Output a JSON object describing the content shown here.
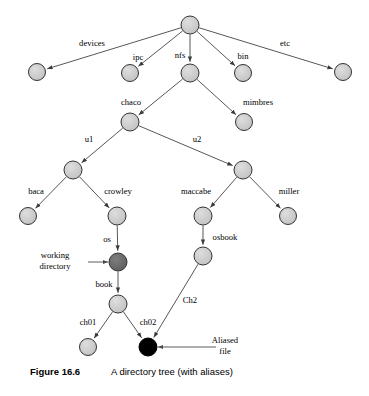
{
  "figure": {
    "caption_number": "Figure 16.6",
    "caption_title": "A directory tree (with aliases)",
    "background_color": "#ffffff"
  },
  "style": {
    "node_fill_normal": "#cccccc",
    "node_fill_working": "#6a6a6a",
    "node_fill_alias": "#000000",
    "node_stroke": "#333333",
    "edge_color": "#444444",
    "text_color": "#000000"
  },
  "diagram": {
    "type": "directory-tree",
    "nodes": [
      {
        "id": "root",
        "label": "",
        "x": 190,
        "y": 25,
        "r": 9,
        "kind": "normal"
      },
      {
        "id": "devices",
        "label": "devices",
        "x": 37,
        "y": 72,
        "r": 8.5,
        "kind": "normal"
      },
      {
        "id": "ipc",
        "label": "ipc",
        "x": 130,
        "y": 73,
        "r": 8.5,
        "kind": "normal"
      },
      {
        "id": "nfs",
        "label": "nfs",
        "x": 190,
        "y": 73,
        "r": 9,
        "kind": "normal"
      },
      {
        "id": "bin",
        "label": "bin",
        "x": 243,
        "y": 73,
        "r": 8.5,
        "kind": "normal"
      },
      {
        "id": "etc",
        "label": "etc",
        "x": 343,
        "y": 72,
        "r": 8.5,
        "kind": "normal"
      },
      {
        "id": "chaco",
        "label": "chaco",
        "x": 130,
        "y": 122,
        "r": 9,
        "kind": "normal"
      },
      {
        "id": "mimbres",
        "label": "mimbres",
        "x": 244,
        "y": 122,
        "r": 8.5,
        "kind": "normal"
      },
      {
        "id": "u1",
        "label": "u1",
        "x": 73,
        "y": 170,
        "r": 9,
        "kind": "normal"
      },
      {
        "id": "u2",
        "label": "u2",
        "x": 243,
        "y": 170,
        "r": 9,
        "kind": "normal"
      },
      {
        "id": "baca",
        "label": "baca",
        "x": 28,
        "y": 216,
        "r": 8.5,
        "kind": "normal"
      },
      {
        "id": "crowley",
        "label": "crowley",
        "x": 117,
        "y": 216,
        "r": 9,
        "kind": "normal"
      },
      {
        "id": "maccabe",
        "label": "maccabe",
        "x": 203,
        "y": 216,
        "r": 9,
        "kind": "normal"
      },
      {
        "id": "miller",
        "label": "miller",
        "x": 288,
        "y": 216,
        "r": 8.5,
        "kind": "normal"
      },
      {
        "id": "os",
        "label": "os",
        "x": 118,
        "y": 262,
        "r": 9,
        "kind": "working"
      },
      {
        "id": "osbook",
        "label": "osbook",
        "x": 203,
        "y": 256,
        "r": 9,
        "kind": "normal"
      },
      {
        "id": "book",
        "label": "book",
        "x": 118,
        "y": 304,
        "r": 9,
        "kind": "normal"
      },
      {
        "id": "ch01",
        "label": "ch01",
        "x": 88,
        "y": 347,
        "r": 8.5,
        "kind": "normal"
      },
      {
        "id": "ch02",
        "label": "ch02",
        "x": 148,
        "y": 347,
        "r": 9,
        "kind": "alias"
      }
    ],
    "edges": [
      {
        "from": "root",
        "to": "devices",
        "label": "devices",
        "label_x": 92,
        "label_y": 46
      },
      {
        "from": "root",
        "to": "ipc",
        "label": "ipc",
        "label_x": 138,
        "label_y": 60
      },
      {
        "from": "root",
        "to": "nfs",
        "label": "nfs",
        "label_x": 180,
        "label_y": 58
      },
      {
        "from": "root",
        "to": "bin",
        "label": "bin",
        "label_x": 243,
        "label_y": 59
      },
      {
        "from": "root",
        "to": "etc",
        "label": "etc",
        "label_x": 285,
        "label_y": 46
      },
      {
        "from": "nfs",
        "to": "chaco",
        "label": "chaco",
        "label_x": 131,
        "label_y": 105
      },
      {
        "from": "nfs",
        "to": "mimbres",
        "label": "mimbres",
        "label_x": 258,
        "label_y": 105
      },
      {
        "from": "chaco",
        "to": "u1",
        "label": "u1",
        "label_x": 89,
        "label_y": 142
      },
      {
        "from": "chaco",
        "to": "u2",
        "label": "u2",
        "label_x": 197,
        "label_y": 142
      },
      {
        "from": "u1",
        "to": "baca",
        "label": "baca",
        "label_x": 36,
        "label_y": 194
      },
      {
        "from": "u1",
        "to": "crowley",
        "label": "crowley",
        "label_x": 118,
        "label_y": 194
      },
      {
        "from": "u2",
        "to": "maccabe",
        "label": "maccabe",
        "label_x": 196,
        "label_y": 194
      },
      {
        "from": "u2",
        "to": "miller",
        "label": "miller",
        "label_x": 289,
        "label_y": 194
      },
      {
        "from": "crowley",
        "to": "os",
        "label": "os",
        "label_x": 107,
        "label_y": 242
      },
      {
        "from": "maccabe",
        "to": "osbook",
        "label": "osbook",
        "label_x": 225,
        "label_y": 240
      },
      {
        "from": "os",
        "to": "book",
        "label": "book",
        "label_x": 104,
        "label_y": 287
      },
      {
        "from": "book",
        "to": "ch01",
        "label": "ch01",
        "label_x": 88,
        "label_y": 325
      },
      {
        "from": "book",
        "to": "ch02",
        "label": "ch02",
        "label_x": 148,
        "label_y": 325
      },
      {
        "from": "osbook",
        "to": "ch02",
        "label": "Ch2",
        "label_x": 190,
        "label_y": 303
      }
    ],
    "callouts": [
      {
        "id": "working-directory",
        "line1": "working",
        "line2": "directory",
        "text_x": 55,
        "text_y": 258,
        "arrow_from_x": 88,
        "arrow_from_y": 262,
        "arrow_to_x": 108,
        "arrow_to_y": 262,
        "target": "os"
      },
      {
        "id": "aliased-file",
        "line1": "Aliased",
        "line2": "file",
        "text_x": 225,
        "text_y": 343,
        "arrow_from_x": 216,
        "arrow_from_y": 347,
        "arrow_to_x": 158,
        "arrow_to_y": 347,
        "target": "ch02"
      }
    ]
  }
}
